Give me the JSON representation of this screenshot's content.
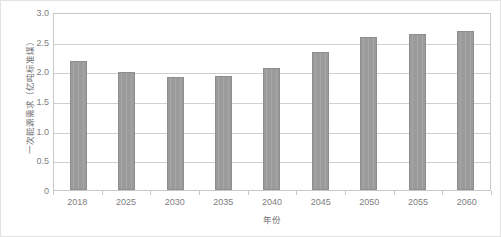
{
  "chart_data": {
    "type": "bar",
    "title": "",
    "xlabel": "年份",
    "ylabel": "一次能源需求（亿吨标准煤）",
    "categories": [
      "2018",
      "2025",
      "2030",
      "2035",
      "2040",
      "2045",
      "2050",
      "2055",
      "2060"
    ],
    "values": [
      2.18,
      1.99,
      1.91,
      1.93,
      2.05,
      2.32,
      2.58,
      2.63,
      2.68
    ],
    "series": [
      {
        "name": "一次能源需求",
        "values": [
          2.18,
          1.99,
          1.91,
          1.93,
          2.05,
          2.32,
          2.58,
          2.63,
          2.68
        ]
      }
    ],
    "ylim": [
      0,
      3.0
    ],
    "ytick_labels": [
      "0",
      "0.5",
      "1.0",
      "1.5",
      "2.0",
      "2.5",
      "3.0"
    ],
    "ytick_values": [
      0,
      0.5,
      1.0,
      1.5,
      2.0,
      2.5,
      3.0
    ],
    "grid": "horizontal",
    "legend": "none",
    "bar_color": "#9b9b9b",
    "bar_edge_color": "#8e8e8e",
    "grid_color": "#cfcfcf",
    "axis_color": "#c8c8c8",
    "text_color": "#808080",
    "plot_background": "#ffffff"
  }
}
